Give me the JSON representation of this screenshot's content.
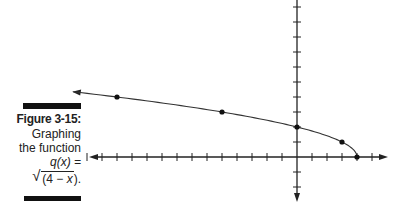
{
  "caption": {
    "figure_label": "Figure 3-15:",
    "line1": "Graphing",
    "line2": "the function",
    "line3": "q(x) =",
    "formula_open": "(4 − ",
    "formula_var": "x",
    "formula_close": ").",
    "radical": "√"
  },
  "colors": {
    "ink": "#222222",
    "bar": "#111111",
    "background": "#ffffff"
  },
  "chart_data": {
    "type": "line",
    "function": "q(x) = sqrt(4 - x)",
    "xlabel": "",
    "ylabel": "",
    "xlim": [
      -14,
      5
    ],
    "ylim": [
      -3,
      10
    ],
    "grid": false,
    "tick_spacing": 1,
    "tick_labels": false,
    "legend": null,
    "points": [
      {
        "x": -12,
        "y": 4
      },
      {
        "x": -5,
        "y": 3
      },
      {
        "x": 0,
        "y": 2
      },
      {
        "x": 3,
        "y": 1
      },
      {
        "x": 4,
        "y": 0
      }
    ],
    "curve_direction": "arrow toward negative x",
    "endpoint": {
      "x": 4,
      "y": 0
    }
  }
}
